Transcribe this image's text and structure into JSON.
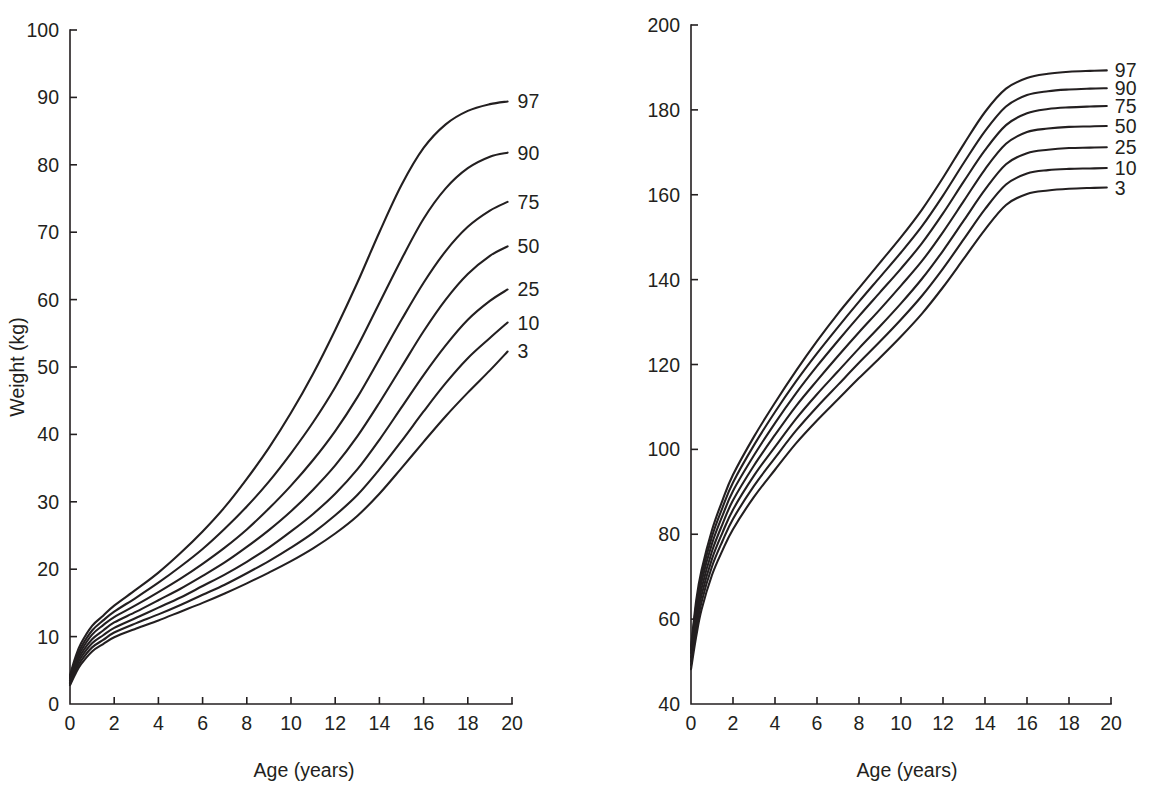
{
  "figure": {
    "background_color": "#ffffff",
    "line_color": "#231f20",
    "panels": [
      "weight",
      "stature"
    ]
  },
  "chart_data": [
    {
      "type": "line",
      "id": "weight-for-age",
      "title": "",
      "xlabel": "Age (years)",
      "ylabel": "Weight (kg)",
      "xlim": [
        0,
        20
      ],
      "ylim": [
        0,
        100
      ],
      "xticks": [
        0,
        2,
        4,
        6,
        8,
        10,
        12,
        14,
        16,
        18,
        20
      ],
      "xtick_labels": [
        "0",
        "2",
        "4",
        "6",
        "8",
        "10",
        "12",
        "14",
        "16",
        "18",
        "20"
      ],
      "yticks": [
        0,
        10,
        20,
        30,
        40,
        50,
        60,
        70,
        80,
        90,
        100
      ],
      "ytick_labels": [
        "0",
        "10",
        "20",
        "30",
        "40",
        "50",
        "60",
        "70",
        "80",
        "90",
        "100"
      ],
      "grid": false,
      "legend_position": "right-inline-labels",
      "x": [
        0,
        0.25,
        0.5,
        1,
        1.5,
        2,
        3,
        4,
        5,
        6,
        7,
        8,
        9,
        10,
        11,
        12,
        13,
        14,
        15,
        16,
        17,
        18,
        19,
        19.8
      ],
      "series": [
        {
          "name": "97",
          "label": "97",
          "values": [
            4.3,
            7.0,
            9.0,
            11.6,
            13.1,
            14.6,
            17.0,
            19.5,
            22.4,
            25.6,
            29.2,
            33.4,
            38.0,
            43.2,
            49.0,
            55.5,
            62.5,
            70.0,
            77.0,
            82.5,
            86.0,
            88.0,
            89.0,
            89.4
          ]
        },
        {
          "name": "90",
          "label": "90",
          "values": [
            4.0,
            6.5,
            8.4,
            10.9,
            12.4,
            13.7,
            15.8,
            18.0,
            20.4,
            23.0,
            26.0,
            29.3,
            33.0,
            37.2,
            41.8,
            47.0,
            53.0,
            59.5,
            66.0,
            72.0,
            76.5,
            79.5,
            81.2,
            81.8
          ]
        },
        {
          "name": "75",
          "label": "75",
          "values": [
            3.8,
            6.1,
            7.9,
            10.3,
            11.7,
            12.9,
            14.7,
            16.6,
            18.6,
            20.8,
            23.2,
            25.9,
            29.0,
            32.4,
            36.2,
            40.5,
            45.5,
            51.2,
            57.0,
            62.5,
            67.2,
            70.8,
            73.2,
            74.5
          ]
        },
        {
          "name": "50",
          "label": "50",
          "values": [
            3.5,
            5.7,
            7.4,
            9.6,
            10.9,
            12.1,
            13.7,
            15.4,
            17.1,
            19.0,
            21.0,
            23.3,
            25.8,
            28.6,
            31.8,
            35.4,
            39.7,
            44.7,
            50.0,
            55.3,
            60.0,
            63.8,
            66.5,
            67.9
          ]
        },
        {
          "name": "25",
          "label": "25",
          "values": [
            3.2,
            5.3,
            6.9,
            9.0,
            10.2,
            11.3,
            12.8,
            14.3,
            15.8,
            17.5,
            19.2,
            21.1,
            23.2,
            25.6,
            28.2,
            31.2,
            34.8,
            39.2,
            44.0,
            48.8,
            53.2,
            57.0,
            59.8,
            61.5
          ]
        },
        {
          "name": "10",
          "label": "10",
          "values": [
            3.0,
            4.9,
            6.4,
            8.4,
            9.5,
            10.6,
            12.0,
            13.3,
            14.7,
            16.2,
            17.7,
            19.4,
            21.2,
            23.2,
            25.4,
            28.0,
            31.0,
            34.8,
            39.0,
            43.4,
            47.6,
            51.3,
            54.3,
            56.6
          ]
        },
        {
          "name": "3",
          "label": "3",
          "values": [
            2.8,
            4.5,
            5.9,
            7.8,
            8.9,
            9.9,
            11.2,
            12.4,
            13.7,
            15.0,
            16.4,
            17.9,
            19.5,
            21.2,
            23.1,
            25.3,
            27.9,
            31.2,
            35.0,
            38.9,
            42.7,
            46.2,
            49.5,
            52.3
          ]
        }
      ],
      "curve_labels": [
        "97",
        "90",
        "75",
        "50",
        "25",
        "10",
        "3"
      ]
    },
    {
      "type": "line",
      "id": "stature-for-age",
      "title": "",
      "xlabel": "Age (years)",
      "ylabel": "Stature (cm)",
      "xlim": [
        0,
        20
      ],
      "ylim": [
        40,
        200
      ],
      "xticks": [
        0,
        2,
        4,
        6,
        8,
        10,
        12,
        14,
        16,
        18,
        20
      ],
      "xtick_labels": [
        "0",
        "2",
        "4",
        "6",
        "8",
        "10",
        "12",
        "14",
        "16",
        "18",
        "20"
      ],
      "yticks": [
        40,
        60,
        80,
        100,
        120,
        140,
        160,
        180,
        200
      ],
      "ytick_labels": [
        "40",
        "60",
        "80",
        "100",
        "120",
        "140",
        "160",
        "180",
        "200"
      ],
      "grid": false,
      "legend_position": "right-inline-labels",
      "x": [
        0,
        0.25,
        0.5,
        1,
        1.5,
        2,
        3,
        4,
        5,
        6,
        7,
        8,
        9,
        10,
        11,
        12,
        13,
        14,
        15,
        16,
        17,
        18,
        19,
        19.8
      ],
      "series": [
        {
          "name": "97",
          "label": "97",
          "values": [
            53.5,
            64.5,
            71.5,
            81.0,
            88.0,
            94.0,
            103.0,
            111.0,
            118.5,
            125.5,
            132.0,
            138.0,
            144.0,
            150.0,
            156.5,
            164.0,
            172.0,
            179.5,
            185.0,
            187.5,
            188.5,
            189.0,
            189.2,
            189.3
          ]
        },
        {
          "name": "90",
          "label": "90",
          "values": [
            52.8,
            63.3,
            70.2,
            79.5,
            86.3,
            92.2,
            101.0,
            108.8,
            116.0,
            122.6,
            128.8,
            134.8,
            140.6,
            146.4,
            152.6,
            159.8,
            167.6,
            175.0,
            180.8,
            183.5,
            184.4,
            184.8,
            185.0,
            185.1
          ]
        },
        {
          "name": "75",
          "label": "75",
          "values": [
            52.0,
            62.0,
            68.8,
            77.8,
            84.4,
            90.2,
            98.6,
            106.2,
            113.2,
            119.6,
            125.6,
            131.4,
            137.0,
            142.6,
            148.6,
            155.6,
            163.2,
            170.5,
            176.4,
            179.2,
            180.2,
            180.6,
            180.8,
            180.9
          ]
        },
        {
          "name": "50",
          "label": "50",
          "values": [
            51.0,
            60.5,
            67.2,
            76.0,
            82.4,
            88.0,
            96.2,
            103.4,
            110.2,
            116.2,
            122.0,
            127.6,
            133.0,
            138.6,
            144.4,
            151.2,
            158.6,
            166.0,
            172.0,
            174.8,
            175.6,
            176.0,
            176.1,
            176.2
          ]
        },
        {
          "name": "25",
          "label": "25",
          "values": [
            50.0,
            59.0,
            65.6,
            74.2,
            80.4,
            85.8,
            93.8,
            100.6,
            107.2,
            113.0,
            118.4,
            123.8,
            129.0,
            134.4,
            140.2,
            146.8,
            154.0,
            161.2,
            167.2,
            169.8,
            170.6,
            171.0,
            171.1,
            171.2
          ]
        },
        {
          "name": "10",
          "label": "10",
          "values": [
            49.2,
            57.6,
            64.0,
            72.4,
            78.4,
            83.6,
            91.4,
            98.0,
            104.4,
            110.0,
            115.2,
            120.4,
            125.4,
            130.6,
            136.2,
            142.6,
            149.6,
            156.6,
            162.4,
            165.0,
            165.8,
            166.1,
            166.2,
            166.3
          ]
        },
        {
          "name": "3",
          "label": "3",
          "values": [
            48.2,
            56.0,
            62.2,
            70.4,
            76.2,
            81.2,
            88.8,
            95.2,
            101.4,
            106.8,
            111.8,
            116.8,
            121.6,
            126.6,
            132.0,
            138.2,
            145.0,
            151.8,
            157.6,
            160.2,
            161.0,
            161.4,
            161.6,
            161.7
          ]
        }
      ],
      "curve_labels": [
        "97",
        "90",
        "75",
        "50",
        "25",
        "10",
        "3"
      ]
    }
  ]
}
